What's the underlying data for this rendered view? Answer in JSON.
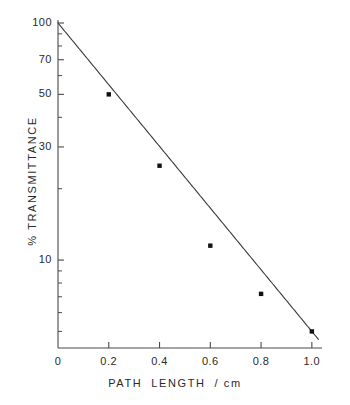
{
  "chart_data": {
    "type": "line",
    "title": "",
    "xlabel": "PATH  LENGTH  / cm",
    "ylabel": "% TRANSMITTANCE",
    "yscale": "log",
    "xscale": "linear",
    "xlim": [
      0,
      1.04
    ],
    "ylim": [
      4.6,
      100
    ],
    "grid": false,
    "legend": null,
    "xticks": [
      {
        "value": 0,
        "label": "0"
      },
      {
        "value": 0.2,
        "label": "0.2"
      },
      {
        "value": 0.4,
        "label": "0.4"
      },
      {
        "value": 0.6,
        "label": "0.6"
      },
      {
        "value": 0.8,
        "label": "0.8"
      },
      {
        "value": 1.0,
        "label": "1.0"
      }
    ],
    "yticks": [
      {
        "value": 100,
        "label": "100"
      },
      {
        "value": 70,
        "label": "70"
      },
      {
        "value": 50,
        "label": "50"
      },
      {
        "value": 30,
        "label": "30"
      },
      {
        "value": 10,
        "label": "10"
      }
    ],
    "yminorticks": [
      90,
      80,
      60,
      40,
      20,
      9,
      8,
      7,
      6,
      5
    ],
    "series": [
      {
        "name": "transmittance",
        "marker": "square",
        "marker_color": "#111111",
        "line_color": "#3a3a3a",
        "x": [
          0.0,
          0.2,
          0.4,
          0.6,
          0.8,
          1.0
        ],
        "y": [
          100,
          50,
          25,
          11.5,
          7.2,
          5.0
        ],
        "markers_shown_at": [
          0.2,
          0.4,
          0.6,
          0.8,
          1.0
        ]
      }
    ],
    "annotations": []
  },
  "axis": {
    "x_label_text": "PATH",
    "x_label_text2": "LENGTH",
    "x_label_text3": "/ cm",
    "y_label_text": "% TRANSMITTANCE"
  },
  "colors": {
    "background": "#ffffff",
    "axis": "#4a4a4a",
    "curve": "#3a3a3a",
    "marker": "#111111",
    "text": "#2a2a2a"
  }
}
